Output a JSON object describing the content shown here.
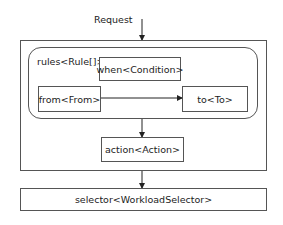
{
  "diagram": {
    "input_label": "Request",
    "rules_label": "rules<Rule[]>",
    "nodes": {
      "when": "when<Condition>",
      "from": "from<From>",
      "to": "to<To>",
      "action": "action<Action>",
      "selector": "selector<WorkloadSelector>"
    },
    "edges": [
      {
        "from": "Request",
        "to": "outer-container"
      },
      {
        "from": "from",
        "to": "to"
      },
      {
        "from": "rules-container",
        "to": "action"
      },
      {
        "from": "outer-container",
        "to": "selector"
      }
    ],
    "colors": {
      "stroke": "#555555",
      "text": "#222222",
      "background": "#ffffff"
    }
  }
}
